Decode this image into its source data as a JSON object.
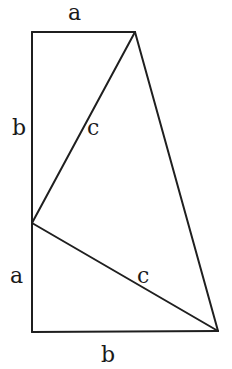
{
  "diagram": {
    "stroke_color": "#1f1f1f",
    "background": "#ffffff",
    "labels": {
      "top_a": "a",
      "left_b": "b",
      "upper_c": "c",
      "left_a": "a",
      "lower_c": "c",
      "bottom_b": "b"
    },
    "vertices": {
      "top_left": [
        32,
        32
      ],
      "top_right": [
        135,
        32
      ],
      "mid_left": [
        32,
        223
      ],
      "bottom_left": [
        32,
        332
      ],
      "bottom_right": [
        218,
        331
      ]
    }
  }
}
